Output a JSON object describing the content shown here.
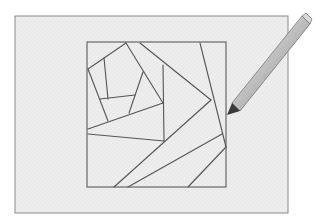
{
  "figure": {
    "colors": {
      "background": "#ffffff",
      "paper_fill": "#ededed",
      "paper_border": "#8a8a8a",
      "line": "#555555",
      "pencil_body": "#c4c4c4",
      "pencil_tip": "#333333"
    },
    "paper": {
      "x": 15,
      "y": 16,
      "width": 273,
      "height": 197
    },
    "block": {
      "x": 87,
      "y": 42,
      "width": 139,
      "height": 145
    },
    "segments": [
      [
        88,
        69,
        126,
        43
      ],
      [
        88,
        69,
        108,
        121
      ],
      [
        104,
        58,
        108,
        99
      ],
      [
        100,
        99,
        135,
        95
      ],
      [
        126,
        43,
        163,
        103
      ],
      [
        143,
        72,
        129,
        113
      ],
      [
        88,
        129,
        163,
        103
      ],
      [
        88,
        134,
        164,
        141
      ],
      [
        163,
        65,
        164,
        141
      ],
      [
        140,
        43,
        211,
        100
      ],
      [
        211,
        100,
        114,
        187
      ],
      [
        200,
        43,
        226,
        147
      ],
      [
        222,
        134,
        128,
        187
      ],
      [
        226,
        147,
        188,
        187
      ]
    ],
    "pencil": {
      "icon": "pencil-icon",
      "tip": [
        227,
        113
      ],
      "end": [
        307,
        21
      ]
    }
  }
}
